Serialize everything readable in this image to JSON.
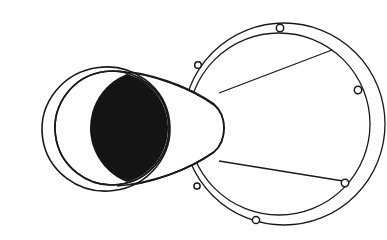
{
  "figure": {
    "title": "Conical horn with bolted flange ring",
    "kind": "technical-line-drawing",
    "background_color": "#ffffff",
    "line_color": "#1a1a1a",
    "shadow_color": "#141414",
    "canvas": {
      "width": 387,
      "height": 240
    }
  },
  "bell_mouth": {
    "name": "bell-mouth",
    "outer_rim": {
      "cx": 106,
      "cy": 129,
      "rx": 64,
      "ry": 63,
      "rotation": -8
    },
    "inner_rim": {
      "cx": 112,
      "cy": 128,
      "rx": 58,
      "ry": 58,
      "rotation": -8
    },
    "bore_shadow": {
      "description": "dark lens-shaped interior of the bore seen obliquely",
      "color": "#141414"
    }
  },
  "cone_body": {
    "name": "cone-body",
    "throat": {
      "x": 219,
      "y": 128,
      "half_height": 48
    },
    "description": "tapering conical shell from bell mouth to narrow throat"
  },
  "flange_ring": {
    "name": "flange-ring",
    "outer_circle": {
      "cx": 284,
      "cy": 124,
      "r": 101
    },
    "inner_circle": {
      "cx": 279,
      "cy": 124,
      "r": 91
    },
    "band_width": 10,
    "bolt_hole_count": 6,
    "bolt_holes": [
      {
        "id": "bolt-hole-top",
        "cx": 279,
        "cy": 28,
        "r": 3.6
      },
      {
        "id": "bolt-hole-upper-left",
        "cx": 198,
        "cy": 65,
        "r": 3.4
      },
      {
        "id": "bolt-hole-right",
        "cx": 358,
        "cy": 90,
        "r": 3.6
      },
      {
        "id": "bolt-hole-lower-right",
        "cx": 345,
        "cy": 183,
        "r": 3.6
      },
      {
        "id": "bolt-hole-bottom",
        "cx": 256,
        "cy": 220,
        "r": 3.5
      },
      {
        "id": "bolt-hole-lower-left",
        "cx": 197,
        "cy": 186,
        "r": 3.2
      }
    ]
  },
  "tangent_lines": [
    {
      "id": "tangent-upper",
      "from": [
        219,
        92
      ],
      "to": [
        330,
        51
      ]
    },
    {
      "id": "tangent-lower",
      "from": [
        219,
        162
      ],
      "to": [
        341,
        180
      ]
    }
  ]
}
